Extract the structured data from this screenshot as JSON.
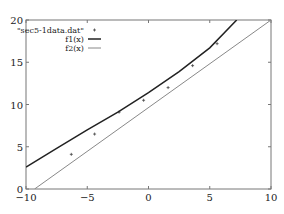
{
  "chart_data": {
    "type": "line",
    "title": "",
    "xlabel": "",
    "ylabel": "",
    "xlim": [
      -10,
      10
    ],
    "ylim": [
      0,
      20
    ],
    "xticks": [
      -10,
      -5,
      0,
      5,
      10
    ],
    "yticks": [
      0,
      5,
      10,
      15,
      20
    ],
    "xtick_labels": [
      "-10",
      "-5",
      "0",
      "5",
      "10"
    ],
    "ytick_labels": [
      "0",
      "5",
      "10",
      "15",
      "20"
    ],
    "grid": false,
    "legend_position": "top-left",
    "series": [
      {
        "name": "\"sec5-1data.dat\"",
        "style": "points",
        "marker": "+",
        "color": "#444444",
        "x": [
          -6.3,
          -4.4,
          -2.4,
          -0.4,
          1.6,
          3.6,
          5.6
        ],
        "y": [
          4.1,
          6.5,
          9.1,
          10.5,
          12.0,
          14.6,
          17.2
        ]
      },
      {
        "name": "f1(x)",
        "style": "line",
        "color": "#222222",
        "x": [
          -10,
          -7.5,
          -5,
          -2.5,
          0,
          2.5,
          5,
          7.2
        ],
        "y": [
          2.6,
          4.8,
          7.0,
          9.1,
          11.4,
          13.9,
          16.7,
          20.0
        ]
      },
      {
        "name": "f2(x)",
        "style": "line",
        "color": "#888888",
        "x": [
          -9.3,
          10
        ],
        "y": [
          0,
          20
        ]
      }
    ]
  }
}
